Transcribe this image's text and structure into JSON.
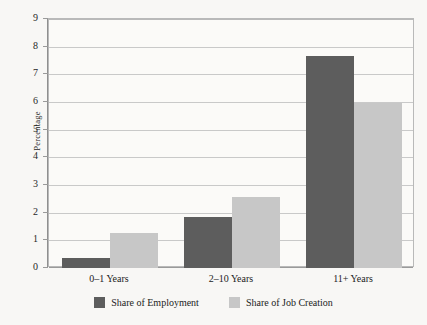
{
  "chart_data": {
    "type": "bar",
    "title": "",
    "subtitle": "",
    "xlabel": "",
    "ylabel": "Percentage",
    "categories": [
      "0–1 Years",
      "2–10 Years",
      "11+ Years"
    ],
    "series": [
      {
        "name": "Share of Employment",
        "color": "#5d5d5d",
        "values": [
          0.36,
          1.85,
          7.68
        ]
      },
      {
        "name": "Share of Job Creation",
        "color": "#c7c7c7",
        "values": [
          1.26,
          2.57,
          5.96
        ]
      }
    ],
    "ylim": [
      0,
      9
    ],
    "yticks": [
      0,
      1,
      2,
      3,
      4,
      5,
      6,
      7,
      8,
      9
    ],
    "ytick_labels": [
      "0",
      "1",
      "2",
      "3",
      "4",
      "5",
      "6",
      "7",
      "8",
      "9"
    ],
    "grid": true,
    "grid_axis": "y",
    "legend_position": "bottom",
    "annotations": []
  },
  "colors": {
    "background": "#f8f7f5",
    "plot_background": "#fbfaf8",
    "gridline": "#c9c9c9",
    "axis": "#8f8f8f",
    "frame": "#b9b9b9",
    "text": "#232323"
  }
}
